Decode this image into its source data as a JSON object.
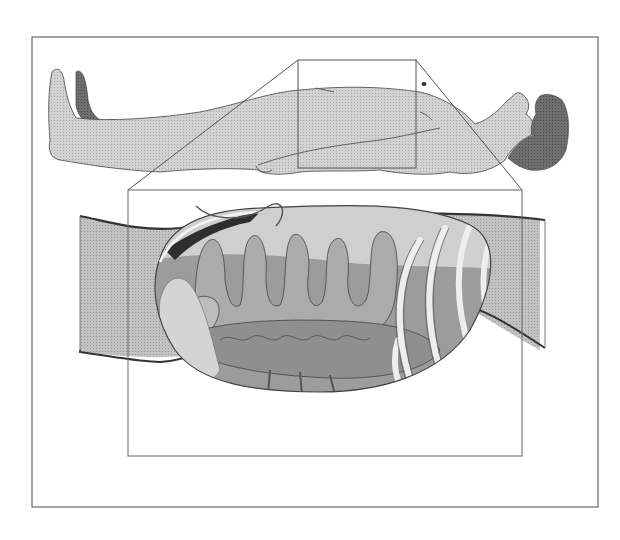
{
  "figure": {
    "colors": {
      "background": "#ffffff",
      "frame": "#555555",
      "skin": "#cfcfcf",
      "skin_dark": "#777777",
      "hair": "#6a6a6a",
      "outline": "#444444",
      "wall": "#bdbdbd",
      "wall_edge": "#333333",
      "intestine": "#a8a8a8",
      "colon": "#8e8e8e",
      "ribs": "#eeeeee",
      "cavity_dark": "#333333",
      "liver": "#d8d8d8"
    }
  }
}
